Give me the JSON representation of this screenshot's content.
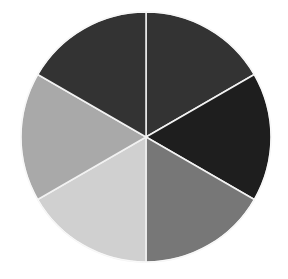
{
  "chart_data": {
    "type": "pie",
    "title": "",
    "categories": [
      "Slice 1",
      "Slice 2",
      "Slice 3",
      "Slice 4",
      "Slice 5",
      "Slice 6"
    ],
    "values": [
      16.67,
      16.67,
      16.67,
      16.67,
      16.67,
      16.67
    ],
    "colors": [
      "#333333",
      "#1e1e1e",
      "#777777",
      "#d0d0d0",
      "#a9a9a9",
      "#333333"
    ],
    "start_angle_deg": 0,
    "direction": "clockwise",
    "legend": "none",
    "labels_shown": false,
    "separator_color": "#f2f2f2",
    "center": [
      146,
      137
    ],
    "radius": 125
  }
}
